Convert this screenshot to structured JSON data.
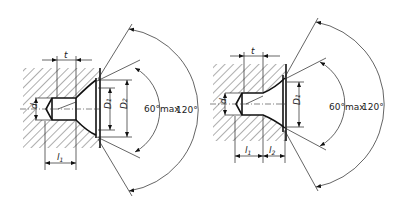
{
  "figures": [
    {
      "id": "left",
      "labels": {
        "t": "t",
        "l1": "l",
        "l1_sub": "1",
        "d": "d",
        "D1": "D",
        "D1_sub": "1",
        "D2": "D",
        "D2_sub": "2"
      },
      "angles": {
        "inner": "60°max",
        "outer": "120°"
      }
    },
    {
      "id": "right",
      "labels": {
        "t": "t",
        "l1": "l",
        "l1_sub": "1",
        "l2": "l",
        "l2_sub": "2",
        "d": "d",
        "D1": "D",
        "D1_sub": "1"
      },
      "angles": {
        "inner": "60°max",
        "outer": "120°"
      }
    }
  ],
  "colors": {
    "line": "#111111",
    "background": "#ffffff"
  }
}
